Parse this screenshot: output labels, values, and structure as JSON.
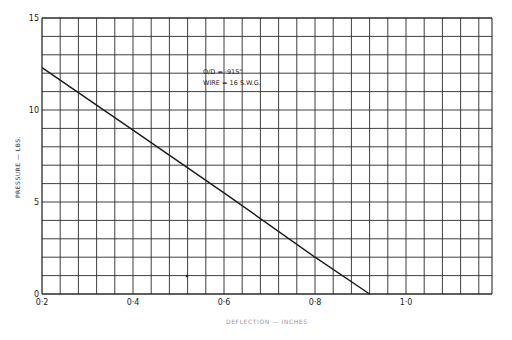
{
  "chart_data": {
    "type": "line",
    "title": "",
    "xlabel": "DEFLECTION — INCHES",
    "ylabel": "PRESSURE — LBS.",
    "xlim": [
      0.2,
      1.2
    ],
    "ylim": [
      0,
      15
    ],
    "x_ticks": [
      0.2,
      0.4,
      0.6,
      0.8,
      1.0
    ],
    "x_tick_labels": [
      "0·2",
      "0·4",
      "0·6",
      "0·8",
      "1·0"
    ],
    "y_ticks": [
      0,
      5,
      10,
      15
    ],
    "y_tick_labels": [
      "0",
      "5",
      "10",
      "15"
    ],
    "grid": true,
    "grid_x_step": 0.04,
    "grid_y_step": 1,
    "series": [
      {
        "name": "Spring characteristic",
        "x": [
          0.2,
          0.4,
          0.6,
          0.8,
          0.92
        ],
        "y": [
          12.3,
          8.9,
          5.5,
          2.0,
          0
        ]
      }
    ],
    "annotations": [
      "O/D = ·915\"",
      "WIRE = 16 S.W.G."
    ]
  },
  "colors": {
    "background": "#ffffff",
    "grid": "#2a2a2a",
    "line": "#1a1a1a"
  }
}
